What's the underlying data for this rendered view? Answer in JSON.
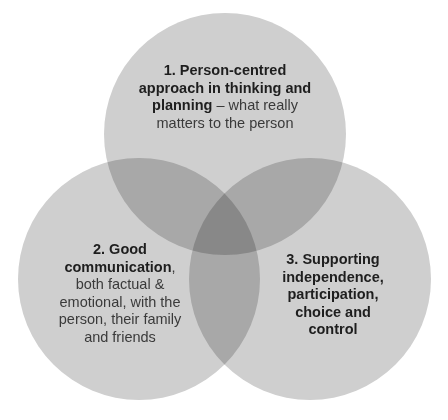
{
  "diagram": {
    "type": "venn",
    "colors": {
      "circle": "#cfcfcf",
      "overlap": "#b3b3b3",
      "center": "#9a9a9a",
      "text": "#222222"
    },
    "circles": [
      {
        "id": 1,
        "number": "1.",
        "bold": "Person-centred approach in thinking and planning",
        "normal": " – what really matters to the person",
        "lines": [
          {
            "bold": "1. Person-centred"
          },
          {
            "bold": "approach in thinking and"
          },
          {
            "bold": "planning",
            "normal": " – what really"
          },
          {
            "normal": "matters to the person"
          }
        ]
      },
      {
        "id": 2,
        "lines": [
          {
            "bold": "2. Good"
          },
          {
            "bold": "communication",
            "normal": ","
          },
          {
            "normal": "both factual &"
          },
          {
            "normal": "emotional, with the"
          },
          {
            "normal": "person, their family"
          },
          {
            "normal": "and friends"
          }
        ]
      },
      {
        "id": 3,
        "lines": [
          {
            "bold": "3. Supporting"
          },
          {
            "bold": "independence,"
          },
          {
            "bold": "participation,"
          },
          {
            "bold": "choice and"
          },
          {
            "bold": "control"
          }
        ]
      }
    ]
  }
}
